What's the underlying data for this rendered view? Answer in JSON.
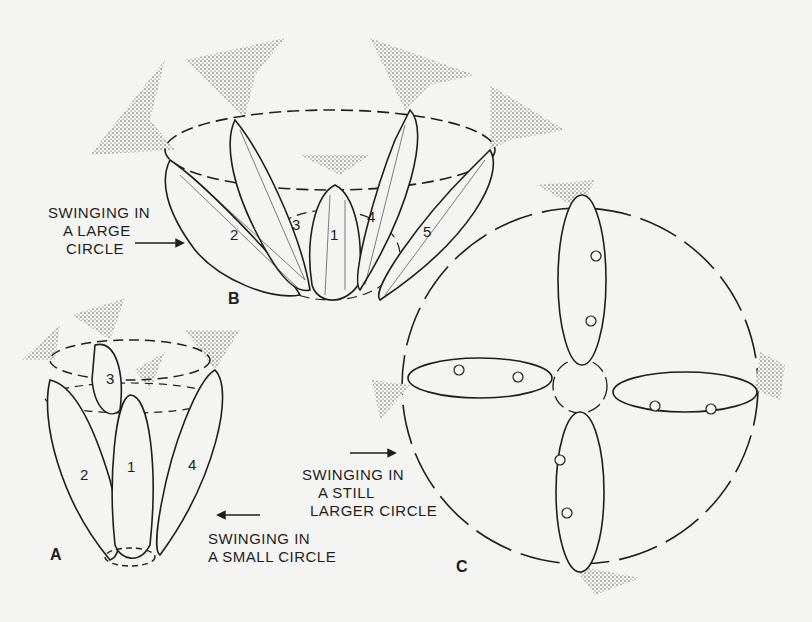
{
  "figure": {
    "panels": [
      {
        "id": "A",
        "letter": "A",
        "caption_lines": [
          "SWINGING IN",
          "A SMALL CIRCLE"
        ],
        "stem_numbers": [
          "1",
          "2",
          "3",
          "4"
        ]
      },
      {
        "id": "B",
        "letter": "B",
        "caption_lines": [
          "SWINGING IN",
          "A LARGE",
          "CIRCLE"
        ],
        "stem_numbers": [
          "1",
          "2",
          "3",
          "4",
          "5"
        ]
      },
      {
        "id": "C",
        "letter": "C",
        "caption_lines": [
          "SWINGING IN",
          "A STILL",
          "LARGER CIRCLE"
        ]
      }
    ],
    "colors": {
      "background": "#f4f4f2",
      "ink": "#1e1e1e",
      "stipple": "#555555"
    }
  }
}
